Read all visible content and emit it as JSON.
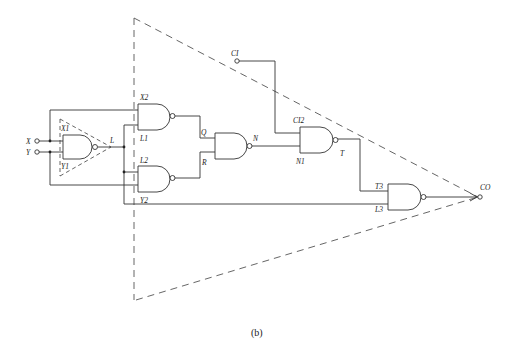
{
  "caption": "(b)",
  "inputs": {
    "x": "X",
    "y": "Y",
    "ci": "CI"
  },
  "output": {
    "co": "CO"
  },
  "labels": {
    "x1": "X1",
    "y1": "Y1",
    "l": "L",
    "x2": "X2",
    "l1": "L1",
    "l2": "L2",
    "y2": "Y2",
    "q": "Q",
    "r": "R",
    "n": "N",
    "ci2": "CI2",
    "n1": "N1",
    "t": "T",
    "t3": "T3",
    "l3": "L3"
  },
  "colors": {
    "line": "#333333",
    "dashed": "#555555",
    "background": "#ffffff"
  }
}
